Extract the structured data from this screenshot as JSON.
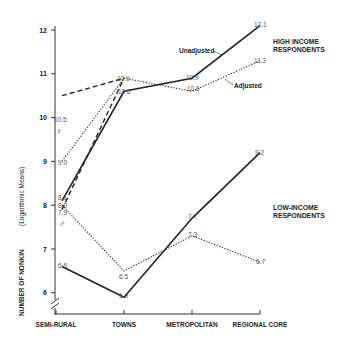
{
  "chart_data": {
    "type": "line",
    "title": "",
    "xlabel": "",
    "ylabel": "NUMBER OF NONKIN",
    "ylabel_sub": "(Logarithmic Means)",
    "categories": [
      "SEMI-RURAL",
      "TOWNS",
      "METROPOLITAN",
      "REGIONAL CORE"
    ],
    "yticks": [
      6,
      7,
      8,
      9,
      10,
      11,
      12
    ],
    "ylim": [
      5.5,
      12.1
    ],
    "grid": false,
    "groups": [
      {
        "label": "HIGH INCOME RESPONDENTS"
      },
      {
        "label": "LOW-INCOME RESPONDENTS"
      }
    ],
    "series": [
      {
        "name": "High income - Unadjusted",
        "style": "solid",
        "values": [
          8.1,
          10.6,
          10.9,
          12.1
        ]
      },
      {
        "name": "High income - Adjusted",
        "style": "dotted",
        "values": [
          9.0,
          10.9,
          10.6,
          11.3
        ]
      },
      {
        "name": "Low income - Unadjusted",
        "style": "solid",
        "values": [
          6.6,
          5.9,
          7.7,
          9.2
        ]
      },
      {
        "name": "Low income - Adjusted",
        "style": "dotted",
        "values": [
          8.0,
          6.5,
          7.3,
          6.7
        ]
      },
      {
        "name": "Female (semi-rural to towns)",
        "style": "dashed",
        "values": [
          10.5,
          10.9,
          null,
          null
        ]
      },
      {
        "name": "Male (semi-rural to towns)",
        "style": "dashed",
        "values": [
          7.9,
          10.9,
          null,
          null
        ]
      }
    ],
    "annotations": [
      "Unadjusted",
      "Adjusted",
      "♀",
      "♂"
    ]
  },
  "labels": {
    "unadjusted": "Unadjusted",
    "adjusted": "Adjusted",
    "high_income_1": "HIGH INCOME",
    "high_income_2": "RESPONDENTS",
    "low_income_1": "LOW-INCOME",
    "low_income_2": "RESPONDENTS",
    "ylabel": "NUMBER OF NONKIN",
    "ylabel_sub": "(Logarithmic Means)",
    "female": "♀",
    "male": "♂"
  }
}
